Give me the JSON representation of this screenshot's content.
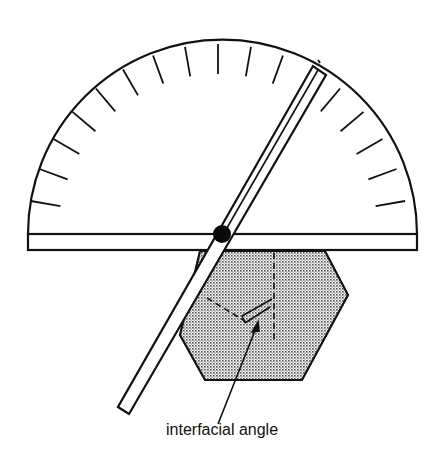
{
  "figure": {
    "label": "interfacial angle",
    "colors": {
      "ink": "#111111",
      "background": "#ffffff",
      "crystal_fill": "#cfcfcf"
    },
    "protractor": {
      "center": [
        218,
        234
      ],
      "radius": 190,
      "tick_count": 19,
      "tick_spacing_deg": 10,
      "tick_length": 30
    },
    "arm_angle_deg": 60,
    "components": [
      "protractor-scale",
      "pivot-arm",
      "pivot-pin",
      "crystal-section",
      "interfacial-angle-marker"
    ]
  }
}
